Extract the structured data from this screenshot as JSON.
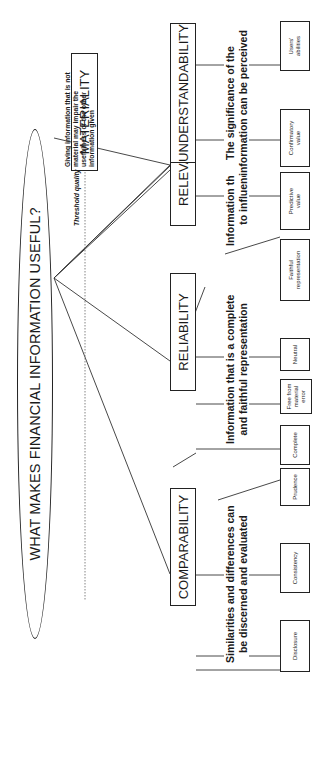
{
  "diagram": {
    "title": "WHAT MAKES FINANCIAL INFORMATION USEFUL?",
    "threshold_label": "Threshold quality",
    "materiality": {
      "label": "MATERIALITY",
      "note": "Giving information that is not material may impair the usefulness of the other information given",
      "note_lines": [
        "Giving information that is not",
        "material may impair the",
        "usefulness of the other",
        "information given"
      ]
    },
    "characteristics": [
      {
        "label": "RELEVANCE",
        "description_lines": [
          "Information that has the ability",
          "to influence decisions"
        ],
        "attributes": [
          {
            "lines": [
              "Predictive",
              "value"
            ]
          },
          {
            "lines": [
              "Confirmatory",
              "value"
            ]
          }
        ]
      },
      {
        "label": "RELIABILITY",
        "description_lines": [
          "Information that is a complete",
          "and faithful representation"
        ],
        "attributes": [
          {
            "lines": [
              "Faithful",
              "representation"
            ]
          },
          {
            "lines": [
              "Neutral"
            ]
          },
          {
            "lines": [
              "Free from",
              "material",
              "error"
            ]
          },
          {
            "lines": [
              "Complete"
            ]
          },
          {
            "lines": [
              "Prudence"
            ]
          }
        ]
      },
      {
        "label": "COMPARABILITY",
        "description_lines": [
          "Similarities and differences can",
          "be discerned and evaluated"
        ],
        "attributes": [
          {
            "lines": [
              "Consistency"
            ]
          },
          {
            "lines": [
              "Disclosure"
            ]
          }
        ]
      },
      {
        "label": "UNDERSTANDABILITY",
        "description_lines": [
          "The significance of the",
          "information can be perceived"
        ],
        "attributes": [
          {
            "lines": [
              "Users'",
              "abilities"
            ]
          },
          {
            "lines": [
              "Aggregation",
              "and",
              "classification"
            ]
          }
        ]
      }
    ]
  }
}
